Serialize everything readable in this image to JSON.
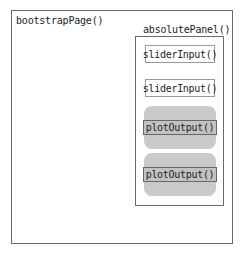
{
  "diagram": {
    "outer": {
      "label": "bootstrapPage()"
    },
    "panel": {
      "label": "absolutePanel()",
      "items": [
        {
          "type": "input",
          "label": "sliderInput()"
        },
        {
          "type": "input",
          "label": "sliderInput()"
        },
        {
          "type": "output",
          "label": "plotOutput()"
        },
        {
          "type": "output",
          "label": "plotOutput()"
        }
      ]
    },
    "colors": {
      "border": "#6a6a6a",
      "output_bg": "#c9c9c9"
    }
  }
}
